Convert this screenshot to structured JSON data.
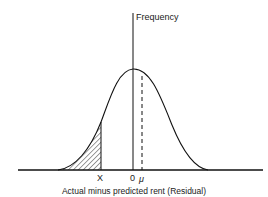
{
  "diagram": {
    "y_axis_label": "Frequency",
    "x_axis_label": "Actual minus predicted rent (Residual)",
    "tick_labels": {
      "x_point": "X",
      "zero": "0",
      "mean": "μ"
    },
    "curve": "normal-distribution",
    "shaded_region": "left tail below X (hatched)",
    "mean_marker": "dashed vertical line at μ"
  }
}
